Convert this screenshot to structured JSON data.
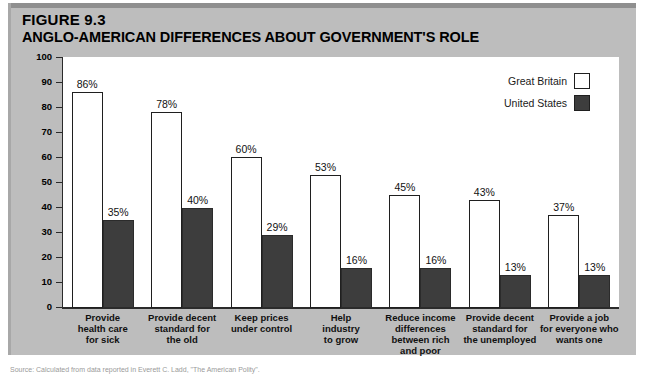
{
  "figure": {
    "number_prefix": "F",
    "number_rest": "IGURE",
    "number_label": "FIGURE 9.3",
    "number_value": "9.3",
    "title": "ANGLO-AMERICAN DIFFERENCES ABOUT GOVERNMENT'S ROLE",
    "source_note": "Source: Calculated from data reported in Everett C. Ladd, \"The American Polity\"."
  },
  "colors": {
    "panel_background": "#bdbdbd",
    "panel_topbar": "#8f8f8f",
    "plot_background": "#ffffff",
    "great_britain": "#ffffff",
    "united_states": "#3d3d3d",
    "axis": "#2b2b2b",
    "text": "#000000"
  },
  "legend": {
    "position": "top-right",
    "entries": [
      {
        "label": "Great Britain",
        "swatch": "#ffffff"
      },
      {
        "label": "United States",
        "swatch": "#3d3d3d"
      }
    ]
  },
  "axes": {
    "y_title": "PERCENTAGE",
    "y_ticks": [
      "100",
      "90",
      "80",
      "70",
      "60",
      "50",
      "40",
      "30",
      "20",
      "10",
      "0"
    ],
    "y_min": 0,
    "y_max": 100
  },
  "chart_data": {
    "type": "bar",
    "title": "ANGLO-AMERICAN DIFFERENCES ABOUT GOVERNMENT'S ROLE",
    "subtitle": "FIGURE 9.3",
    "xlabel": "",
    "ylabel": "PERCENTAGE",
    "ylim": [
      0,
      100
    ],
    "grid": false,
    "legend_position": "top-right",
    "categories": [
      "Provide health care for sick",
      "Provide decent standard for the old",
      "Keep prices under control",
      "Help industry to grow",
      "Reduce income differences between rich and poor",
      "Provide decent standard for the unemployed",
      "Provide a job for everyone who wants one"
    ],
    "category_lines": [
      [
        "Provide",
        "health care",
        "for sick"
      ],
      [
        "Provide decent",
        "standard for",
        "the old"
      ],
      [
        "Keep prices",
        "under control"
      ],
      [
        "Help",
        "industry",
        "to grow"
      ],
      [
        "Reduce income",
        "differences",
        "between rich",
        "and poor"
      ],
      [
        "Provide decent",
        "standard for",
        "the unemployed"
      ],
      [
        "Provide a job",
        "for everyone who",
        "wants one"
      ]
    ],
    "series": [
      {
        "name": "Great Britain",
        "color": "#ffffff",
        "values": [
          86,
          78,
          60,
          53,
          45,
          43,
          37
        ],
        "labels": [
          "86%",
          "78%",
          "60%",
          "53%",
          "45%",
          "43%",
          "37%"
        ]
      },
      {
        "name": "United States",
        "color": "#3d3d3d",
        "values": [
          35,
          40,
          29,
          16,
          16,
          13,
          13
        ],
        "labels": [
          "35%",
          "40%",
          "29%",
          "16%",
          "16%",
          "13%",
          "13%"
        ]
      }
    ]
  }
}
